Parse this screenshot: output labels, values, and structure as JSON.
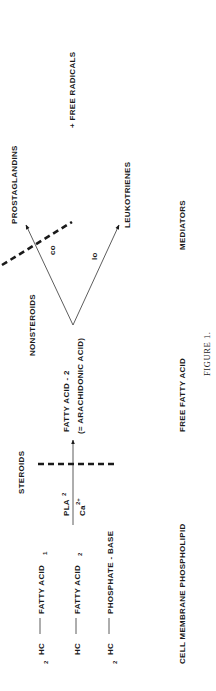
{
  "figure": {
    "caption": "FIGURE 1.",
    "orientation": "rotated 90deg counterclockwise"
  },
  "phospholipid": {
    "rows": [
      {
        "prefix": "HC",
        "prefix_sub": "2",
        "label": "FATTY ACID",
        "label_sub": "1"
      },
      {
        "prefix": "HC",
        "prefix_sub": "",
        "label": "FATTY ACID",
        "label_sub": "2"
      },
      {
        "prefix": "HC",
        "prefix_sub": "2",
        "label": "PHOSPHATE - BASE",
        "label_sub": ""
      }
    ]
  },
  "enzyme": {
    "numerator": "PLA",
    "numerator_sup": "2",
    "denominator": "Ca",
    "denominator_sup": "2+"
  },
  "inhibitors": {
    "steroids": "STEROIDS",
    "nonsteroids": "NONSTEROIDS"
  },
  "free_fatty_acid": {
    "line1": "FATTY ACID - 2",
    "line2": "(= ARACHIDONIC ACID)"
  },
  "pathways": {
    "upper_enzyme": "co",
    "lower_enzyme": "lo",
    "upper_product": "PROSTAGLANDINS",
    "lower_product": "LEUKOTRIENES",
    "extra": "+ FREE RADICALS"
  },
  "bottom_labels": {
    "stage1": "CELL MEMBRANE PHOSPHOLIPID",
    "stage2": "FREE FATTY ACID",
    "stage3": "MEDIATORS"
  },
  "colors": {
    "ink": "#1a1a1a",
    "background": "#ffffff"
  }
}
